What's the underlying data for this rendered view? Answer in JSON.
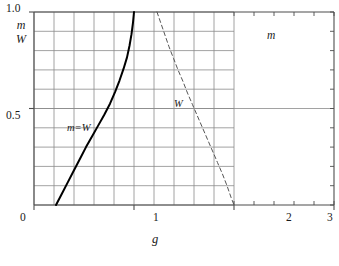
{
  "chart_data": {
    "type": "line",
    "title": "",
    "xlabel": "g",
    "ylabel": "m/W",
    "ylabel_numerator": "m",
    "ylabel_denominator": "W",
    "xlim": [
      0,
      3
    ],
    "ylim": [
      0,
      1.0
    ],
    "xticks": [
      0,
      1,
      2,
      3
    ],
    "xticklabels": [
      "0",
      "1",
      "2",
      "3"
    ],
    "yticks": [
      0.5,
      1.0
    ],
    "yticklabels": [
      "0.5",
      "1.0"
    ],
    "grid": true,
    "grid_x_range": [
      0,
      2
    ],
    "grid_y_range": [
      0,
      1.0
    ],
    "grid_x_step": 0.2,
    "grid_y_step": 0.1,
    "grid_color": "#8a8a8a",
    "axis_color": "#4d4d4d",
    "legend": "none",
    "series": [
      {
        "name": "m=W",
        "label": "m=W",
        "style": "solid",
        "color": "#000000",
        "width": 2.0,
        "points": [
          [
            0.22,
            0.0
          ],
          [
            0.28,
            0.06
          ],
          [
            0.34,
            0.12
          ],
          [
            0.4,
            0.18
          ],
          [
            0.46,
            0.24
          ],
          [
            0.52,
            0.3
          ],
          [
            0.58,
            0.355
          ],
          [
            0.64,
            0.41
          ],
          [
            0.7,
            0.465
          ],
          [
            0.76,
            0.525
          ],
          [
            0.81,
            0.585
          ],
          [
            0.855,
            0.645
          ],
          [
            0.895,
            0.705
          ],
          [
            0.93,
            0.765
          ],
          [
            0.955,
            0.825
          ],
          [
            0.975,
            0.885
          ],
          [
            0.99,
            0.945
          ],
          [
            1.0,
            1.0
          ]
        ]
      },
      {
        "name": "W",
        "label": "W",
        "style": "dashed",
        "color": "#555555",
        "width": 1.0,
        "points": [
          [
            1.23,
            1.0
          ],
          [
            1.27,
            0.94
          ],
          [
            1.31,
            0.88
          ],
          [
            1.35,
            0.82
          ],
          [
            1.395,
            0.76
          ],
          [
            1.44,
            0.7
          ],
          [
            1.49,
            0.64
          ],
          [
            1.535,
            0.58
          ],
          [
            1.585,
            0.52
          ],
          [
            1.635,
            0.46
          ],
          [
            1.685,
            0.4
          ],
          [
            1.735,
            0.34
          ],
          [
            1.785,
            0.28
          ],
          [
            1.835,
            0.22
          ],
          [
            1.885,
            0.16
          ],
          [
            1.93,
            0.1
          ],
          [
            1.97,
            0.04
          ],
          [
            2.0,
            0.0
          ]
        ]
      }
    ],
    "annotations": [
      {
        "text": "m=W",
        "x": 0.62,
        "y": 0.455,
        "name": "curve-label-mw"
      },
      {
        "text": "W",
        "x": 1.43,
        "y": 0.565,
        "name": "curve-label-w"
      },
      {
        "text": "m",
        "x": 2.52,
        "y": 0.88,
        "name": "region-label-m"
      }
    ]
  },
  "axes": {
    "x_axis_label": "g",
    "y_axis_numerator": "m",
    "y_axis_denominator": "W"
  },
  "ticks": {
    "x": [
      "0",
      "1",
      "2",
      "3"
    ],
    "y_top": "1.0",
    "y_mid": "0.5"
  }
}
